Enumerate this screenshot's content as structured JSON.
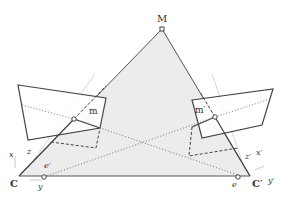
{
  "figure": {
    "labels": {
      "point_3d": "M",
      "image_point_left": "m",
      "image_point_right": "m′",
      "camera_center_left": "C",
      "camera_center_right": "C′",
      "epipole_left": "e",
      "epipole_right": "e′",
      "axis_left_x": "x",
      "axis_left_y": "y",
      "axis_left_z": "z",
      "axis_right_x": "x′",
      "axis_right_y": "y′",
      "axis_right_z": "z′"
    },
    "colors": {
      "plane_fill": "#ececec",
      "line": "#555555",
      "faint_line": "#cccccc",
      "text": "#333333"
    }
  }
}
